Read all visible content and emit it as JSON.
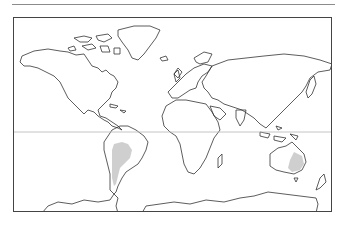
{
  "figure": {
    "type": "distribution-map",
    "projection": "world outline",
    "colors": {
      "outline": "#333333",
      "range_fill": "#cfcfcf",
      "frame": "#444444",
      "equator": "#b5b5b5",
      "top_rule": "#8c8c8c"
    },
    "layers": {
      "equator_line": "equator",
      "shaded_ranges": [
        "South America (Andean / Gran Chaco region)",
        "Eastern Australia"
      ]
    }
  }
}
